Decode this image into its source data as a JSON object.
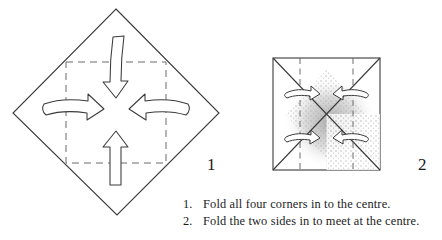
{
  "figure": {
    "title_visible": false,
    "type": "origami-fold-instructions",
    "line_color": "#3a3a3a",
    "dash_color": "#555555",
    "shade_color": "#b9b9b9",
    "text_color": "#1c1c1c"
  },
  "steps": [
    {
      "number": "1",
      "shape": "diamond",
      "description": "Square sheet rotated 45 degrees with dashed inner square and four hollow curved arrows pointing inward toward the centre",
      "arrows": [
        "arrow-down",
        "arrow-right",
        "arrow-left",
        "arrow-up"
      ]
    },
    {
      "number": "2",
      "shape": "square",
      "description": "Square with shaded centre, diagonal crease lines, two dashed vertical fold lines and four hollow curved arrows",
      "arrows": [
        "arrow-right-top",
        "arrow-left-top",
        "arrow-right-bottom",
        "arrow-left-bottom"
      ]
    }
  ],
  "caption": {
    "items": [
      {
        "number": "1.",
        "text": "Fold all four corners in to the centre."
      },
      {
        "number": "2.",
        "text": "Fold the two sides in to meet at the centre."
      }
    ]
  }
}
